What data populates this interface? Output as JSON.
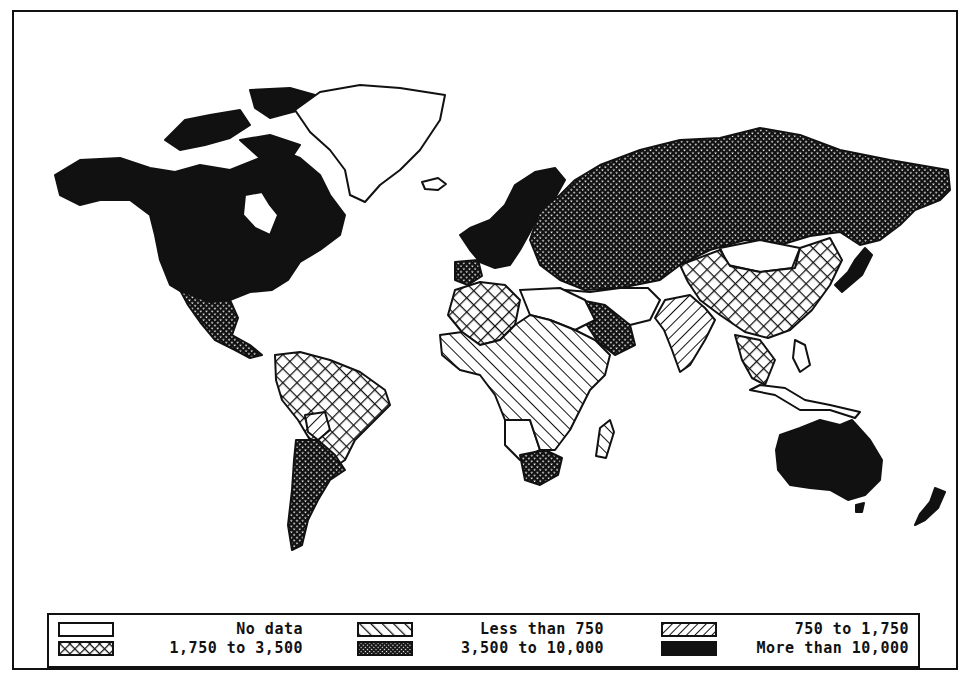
{
  "map": {
    "type": "choropleth world map",
    "style": "monochrome hatch patterns",
    "colors": {
      "ink": "#111111",
      "paper": "#ffffff"
    }
  },
  "legend": {
    "items": [
      {
        "id": "nodata",
        "label": "No data",
        "pattern": "blank"
      },
      {
        "id": "lt750",
        "label": "Less than 750",
        "pattern": "diag-forward"
      },
      {
        "id": "750to1750",
        "label": "750 to 1,750",
        "pattern": "diag-back"
      },
      {
        "id": "1750to3500",
        "label": "1,750 to 3,500",
        "pattern": "crosshatch-large"
      },
      {
        "id": "3500to10000",
        "label": "3,500 to 10,000",
        "pattern": "crosshatch-fine"
      },
      {
        "id": "gt10000",
        "label": "More than 10,000",
        "pattern": "solid"
      }
    ]
  },
  "regions": [
    {
      "name": "North America (US, Canada)",
      "class": "More than 10,000"
    },
    {
      "name": "Greenland",
      "class": "No data"
    },
    {
      "name": "Mexico",
      "class": "1,750 to 3,500"
    },
    {
      "name": "South America (Brazil, Colombia, Peru)",
      "class": "1,750 to 3,500"
    },
    {
      "name": "Bolivia",
      "class": "750 to 1,750"
    },
    {
      "name": "Argentina, Chile",
      "class": "3,500 to 10,000"
    },
    {
      "name": "Western Europe",
      "class": "More than 10,000"
    },
    {
      "name": "USSR",
      "class": "3,500 to 10,000"
    },
    {
      "name": "China",
      "class": "1,750 to 3,500"
    },
    {
      "name": "Mongolia",
      "class": "No data"
    },
    {
      "name": "India",
      "class": "750 to 1,750"
    },
    {
      "name": "Japan",
      "class": "More than 10,000"
    },
    {
      "name": "Australia",
      "class": "More than 10,000"
    },
    {
      "name": "New Zealand",
      "class": "More than 10,000"
    },
    {
      "name": "Saudi Arabia",
      "class": "3,500 to 10,000"
    },
    {
      "name": "North Africa (Algeria)",
      "class": "1,750 to 3,500"
    },
    {
      "name": "Sub-Saharan Africa",
      "class": "Less than 750"
    },
    {
      "name": "South Africa",
      "class": "3,500 to 10,000"
    },
    {
      "name": "Madagascar",
      "class": "Less than 750"
    }
  ]
}
